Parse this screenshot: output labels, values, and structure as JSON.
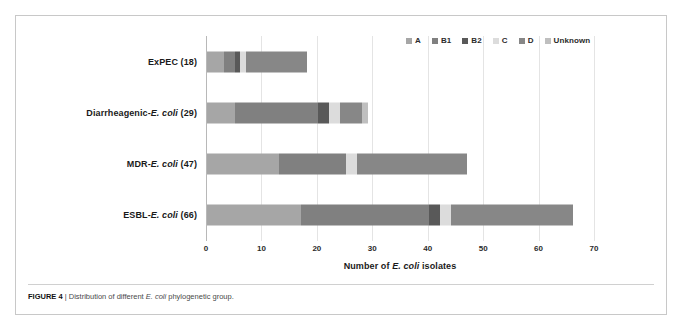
{
  "figure": {
    "caption_label": "FIGURE 4",
    "caption_separator": "|",
    "caption_text_before": "Distribution of different",
    "caption_italic": "E. coli",
    "caption_text_after": "phylogenetic group."
  },
  "axis": {
    "x_title_before": "Number of",
    "x_title_italic": "E. coli",
    "x_title_after": "isolates",
    "ticks": [
      "0",
      "10",
      "20",
      "30",
      "40",
      "50",
      "60",
      "70"
    ]
  },
  "legend": {
    "entries": [
      {
        "label": "A",
        "color": "#a6a6a6"
      },
      {
        "label": "B1",
        "color": "#808080"
      },
      {
        "label": "B2",
        "color": "#595959"
      },
      {
        "label": "C",
        "color": "#dcdcdc"
      },
      {
        "label": "D",
        "color": "#878787"
      },
      {
        "label": "Unknown",
        "color": "#bfbfbf"
      }
    ]
  },
  "categories": [
    {
      "prefix": "ExPEC",
      "italic": "",
      "suffix": " (18)"
    },
    {
      "prefix": "Diarrheagenic-",
      "italic": "E. coli",
      "suffix": " (29)"
    },
    {
      "prefix": "MDR-",
      "italic": "E. coli",
      "suffix": " (47)"
    },
    {
      "prefix": "ESBL-",
      "italic": "E. coli",
      "suffix": " (66)"
    }
  ],
  "chart_data": {
    "type": "bar",
    "orientation": "horizontal",
    "stacked": true,
    "title": "",
    "xlabel": "Number of E. coli isolates",
    "ylabel": "",
    "xlim": [
      0,
      70
    ],
    "xticks": [
      0,
      10,
      20,
      30,
      40,
      50,
      60,
      70
    ],
    "grid": true,
    "legend_position": "top-right",
    "categories": [
      "ExPEC (18)",
      "Diarrheagenic-E. coli (29)",
      "MDR-E. coli (47)",
      "ESBL-E. coli (66)"
    ],
    "category_totals": [
      18,
      29,
      47,
      66
    ],
    "series": [
      {
        "name": "A",
        "color": "#a6a6a6",
        "values": [
          3,
          5,
          13,
          17
        ]
      },
      {
        "name": "B1",
        "color": "#808080",
        "values": [
          2,
          15,
          12,
          23
        ]
      },
      {
        "name": "B2",
        "color": "#595959",
        "values": [
          1,
          2,
          0,
          2
        ]
      },
      {
        "name": "C",
        "color": "#dcdcdc",
        "values": [
          1,
          2,
          2,
          2
        ]
      },
      {
        "name": "D",
        "color": "#878787",
        "values": [
          11,
          4,
          20,
          22
        ]
      },
      {
        "name": "Unknown",
        "color": "#bfbfbf",
        "values": [
          0,
          1,
          0,
          0
        ]
      }
    ]
  }
}
